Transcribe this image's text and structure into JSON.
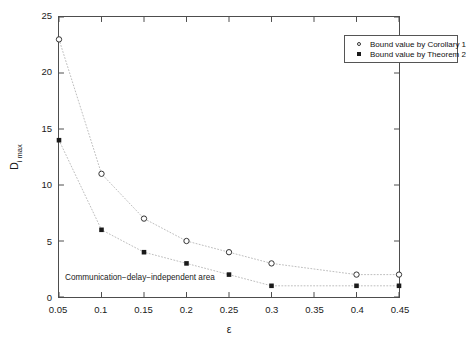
{
  "chart_data": {
    "type": "scatter",
    "title": "",
    "xlabel": "ε",
    "ylabel": "D",
    "ylabel_sub": "i max",
    "xlim": [
      0.05,
      0.45
    ],
    "ylim": [
      0,
      25
    ],
    "xticks": [
      0.05,
      0.1,
      0.15,
      0.2,
      0.25,
      0.3,
      0.35,
      0.4,
      0.45
    ],
    "xticklabels": [
      "0.05",
      "0.1",
      "0.15",
      "0.2",
      "0.25",
      "0.3",
      "0.35",
      "0.4",
      "0.45"
    ],
    "yticks": [
      0,
      5,
      10,
      15,
      20,
      25
    ],
    "yticklabels": [
      "0",
      "5",
      "10",
      "15",
      "20",
      "25"
    ],
    "grid": false,
    "legend_position": "upper right",
    "x": [
      0.05,
      0.1,
      0.15,
      0.2,
      0.25,
      0.3,
      0.4,
      0.45
    ],
    "series": [
      {
        "name": "Bound value by Corollary 1",
        "marker": "open-circle",
        "linestyle": "dotted",
        "color": "#333333",
        "x": [
          0.05,
          0.1,
          0.15,
          0.2,
          0.25,
          0.3,
          0.4,
          0.45
        ],
        "values": [
          23,
          11,
          7,
          5,
          4,
          3,
          2,
          2
        ]
      },
      {
        "name": "Bound value by Theorem 2",
        "marker": "filled-square",
        "linestyle": "dotted",
        "color": "#1a1a1a",
        "x": [
          0.05,
          0.1,
          0.15,
          0.2,
          0.25,
          0.3,
          0.4,
          0.45
        ],
        "values": [
          14,
          6,
          4,
          3,
          2,
          1,
          1,
          1
        ]
      }
    ],
    "annotations": [
      {
        "text": "Communication−delay−independent area",
        "x": 0.057,
        "y": 1.85
      }
    ]
  },
  "legend": {
    "items": [
      {
        "label": "Bound value by Corollary 1",
        "marker": "open-circle"
      },
      {
        "label": "Bound value by Theorem 2",
        "marker": "filled-square"
      }
    ]
  },
  "colors": {
    "axis": "#4d4d4d",
    "marker_open": "#333333",
    "marker_filled": "#1a1a1a",
    "dotted_line": "#bdbdbd",
    "background": "#ffffff"
  }
}
